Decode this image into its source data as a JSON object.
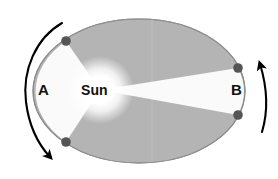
{
  "figure": {
    "background_color": "#ffffff"
  },
  "orbit": {
    "shape": "ellipse",
    "center_x": 139,
    "center_y": 91,
    "radius_x": 106,
    "radius_y": 72,
    "fill_color": "#b4b4b4",
    "stroke_color": "#8c8c8c",
    "stroke_width": 1.1
  },
  "sun": {
    "label": "Sun",
    "center_x": 100,
    "center_y": 90,
    "glow_radius": 34,
    "glow_color": "#ffffff",
    "label_color": "#111111"
  },
  "sectors": [
    {
      "name": "sector-a",
      "label": "A",
      "label_color": "#111111",
      "fill_color": "#fafafa",
      "side": "left",
      "description": "Swept area near aphelion side, bounded by two marker points on the orbit"
    },
    {
      "name": "sector-b",
      "label": "B",
      "label_color": "#111111",
      "fill_color": "#fafafa",
      "side": "right",
      "description": "Swept area on the far side, bounded by two marker points on the orbit"
    }
  ],
  "markers": [
    {
      "name": "marker-upper-left",
      "x": 66,
      "y": 41,
      "r": 4.8,
      "color": "#555555"
    },
    {
      "name": "marker-lower-left",
      "x": 66,
      "y": 142,
      "r": 4.8,
      "color": "#555555"
    },
    {
      "name": "marker-upper-right",
      "x": 238,
      "y": 68,
      "r": 4.8,
      "color": "#555555"
    },
    {
      "name": "marker-lower-right",
      "x": 238,
      "y": 115,
      "r": 4.8,
      "color": "#555555"
    }
  ],
  "arrows": [
    {
      "name": "arrow-left-orbital-direction",
      "direction": "clockwise-downward",
      "color": "#000000",
      "stroke_width": 2.1,
      "head": "filled-triangle",
      "position": "outside left of ellipse"
    },
    {
      "name": "arrow-right-orbital-direction",
      "direction": "upward",
      "color": "#000000",
      "stroke_width": 2.1,
      "head": "filled-triangle",
      "position": "outside right of ellipse"
    }
  ],
  "colors": {
    "orbit_fill": "#b4b4b4",
    "sector_fill": "#fafafa",
    "marker": "#555555",
    "arrow": "#000000",
    "text": "#111111"
  }
}
